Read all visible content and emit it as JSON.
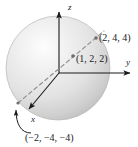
{
  "figure": {
    "background_color": "#ffffff",
    "ink_color": "#1a1a1a"
  },
  "axes": {
    "z_label": "z",
    "y_label": "y",
    "x_label": "x",
    "origin_px": [
      59,
      73
    ],
    "z_tip_px": [
      59,
      10
    ],
    "y_tip_px": [
      133,
      73
    ],
    "x_tip_px": [
      26,
      112
    ]
  },
  "sphere": {
    "name": "shaded-sphere",
    "center_px": [
      58,
      68
    ],
    "radius_px": 52,
    "fill_light": "#f2f2f2",
    "fill_mid": "#dcdcdc",
    "fill_dark": "#c2c2c2",
    "edge_color": "#b5b5b5"
  },
  "points": [
    {
      "id": "p-244",
      "label": "(2, 4, 4)",
      "marker_px": [
        96,
        38
      ],
      "label_px": [
        99,
        33
      ]
    },
    {
      "id": "p-122",
      "label": "(1, 2, 2)",
      "marker_px": [
        73,
        56
      ],
      "label_px": [
        76,
        54
      ]
    },
    {
      "id": "p-neg2-neg4-neg4",
      "label": "(−2, −4, −4)",
      "marker_px": [
        17,
        104
      ],
      "label_px": [
        25,
        133
      ]
    }
  ],
  "lines": {
    "diameter_dashed": {
      "name": "dashed-diameter-line",
      "from_px": [
        17,
        104
      ],
      "to_px": [
        104,
        31
      ],
      "style": "dashed",
      "color": "#8c8c8c"
    },
    "x_axis_segment": {
      "name": "x-axis-solid",
      "from_px": [
        59,
        73
      ],
      "to_px": [
        26,
        112
      ],
      "style": "solid",
      "color": "#1a1a1a"
    },
    "callout_arrow": {
      "name": "curved-callout-arrow",
      "from_px": [
        29,
        132
      ],
      "to_px": [
        17,
        104
      ],
      "style": "curved-solid",
      "color": "#1a1a1a"
    }
  }
}
